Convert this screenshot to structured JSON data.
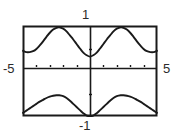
{
  "figure": {
    "kind": "graphing-calculator-plot",
    "frame": {
      "left": 23,
      "top": 26,
      "right": 157,
      "bottom": 116
    },
    "stroke_color": "#1a1a1a",
    "background_color": "#ffffff"
  },
  "labels": {
    "y_max": "1",
    "y_min": "-1",
    "x_min": "-5",
    "x_max": "5"
  },
  "chart_data": {
    "type": "line",
    "title": "",
    "xlabel": "",
    "ylabel": "",
    "xlim": [
      -5,
      5
    ],
    "ylim": [
      -1,
      1
    ],
    "grid": false,
    "legend": "none",
    "axis_ticks": {
      "x_tick_step": 1,
      "x_ticks": [
        -4,
        -3,
        -2,
        -1,
        1,
        2,
        3,
        4
      ],
      "y_tick_step": 0.5,
      "y_ticks": [
        -0.5,
        0.5
      ]
    },
    "series": [
      {
        "name": "upper-curve",
        "x": [
          -5.0,
          -4.75,
          -4.5,
          -4.25,
          -4.0,
          -3.75,
          -3.5,
          -3.25,
          -3.0,
          -2.75,
          -2.5,
          -2.3,
          -2.0,
          -1.75,
          -1.5,
          -1.25,
          -1.0,
          -0.75,
          -0.5,
          -0.25,
          0.0,
          0.25,
          0.5,
          0.75,
          1.0,
          1.25,
          1.5,
          1.75,
          2.0,
          2.3,
          2.5,
          2.75,
          3.0,
          3.25,
          3.5,
          3.75,
          4.0,
          4.25,
          4.5,
          4.75,
          5.0
        ],
        "y": [
          0.45,
          0.42,
          0.42,
          0.44,
          0.49,
          0.57,
          0.66,
          0.76,
          0.85,
          0.92,
          0.96,
          0.97,
          0.94,
          0.88,
          0.79,
          0.7,
          0.6,
          0.5,
          0.41,
          0.35,
          0.32,
          0.35,
          0.41,
          0.5,
          0.6,
          0.7,
          0.79,
          0.88,
          0.94,
          0.97,
          0.96,
          0.92,
          0.85,
          0.76,
          0.66,
          0.57,
          0.49,
          0.44,
          0.42,
          0.42,
          0.45
        ]
      },
      {
        "name": "lower-curve",
        "x": [
          -5.0,
          -4.75,
          -4.5,
          -4.25,
          -4.0,
          -3.75,
          -3.5,
          -3.25,
          -3.0,
          -2.75,
          -2.5,
          -2.3,
          -2.0,
          -1.75,
          -1.5,
          -1.25,
          -1.0,
          -0.75,
          -0.5,
          -0.25,
          0.0,
          0.25,
          0.5,
          0.75,
          1.0,
          1.25,
          1.5,
          1.75,
          2.0,
          2.3,
          2.5,
          2.75,
          3.0,
          3.25,
          3.5,
          3.75,
          4.0,
          4.25,
          4.5,
          4.75,
          5.0
        ],
        "y": [
          -0.93,
          -0.88,
          -0.83,
          -0.78,
          -0.73,
          -0.68,
          -0.64,
          -0.6,
          -0.57,
          -0.55,
          -0.54,
          -0.54,
          -0.56,
          -0.6,
          -0.66,
          -0.73,
          -0.8,
          -0.87,
          -0.94,
          -0.99,
          -1.02,
          -0.99,
          -0.94,
          -0.87,
          -0.8,
          -0.73,
          -0.66,
          -0.6,
          -0.56,
          -0.54,
          -0.54,
          -0.55,
          -0.57,
          -0.6,
          -0.64,
          -0.68,
          -0.73,
          -0.78,
          -0.83,
          -0.88,
          -0.93
        ]
      }
    ]
  }
}
